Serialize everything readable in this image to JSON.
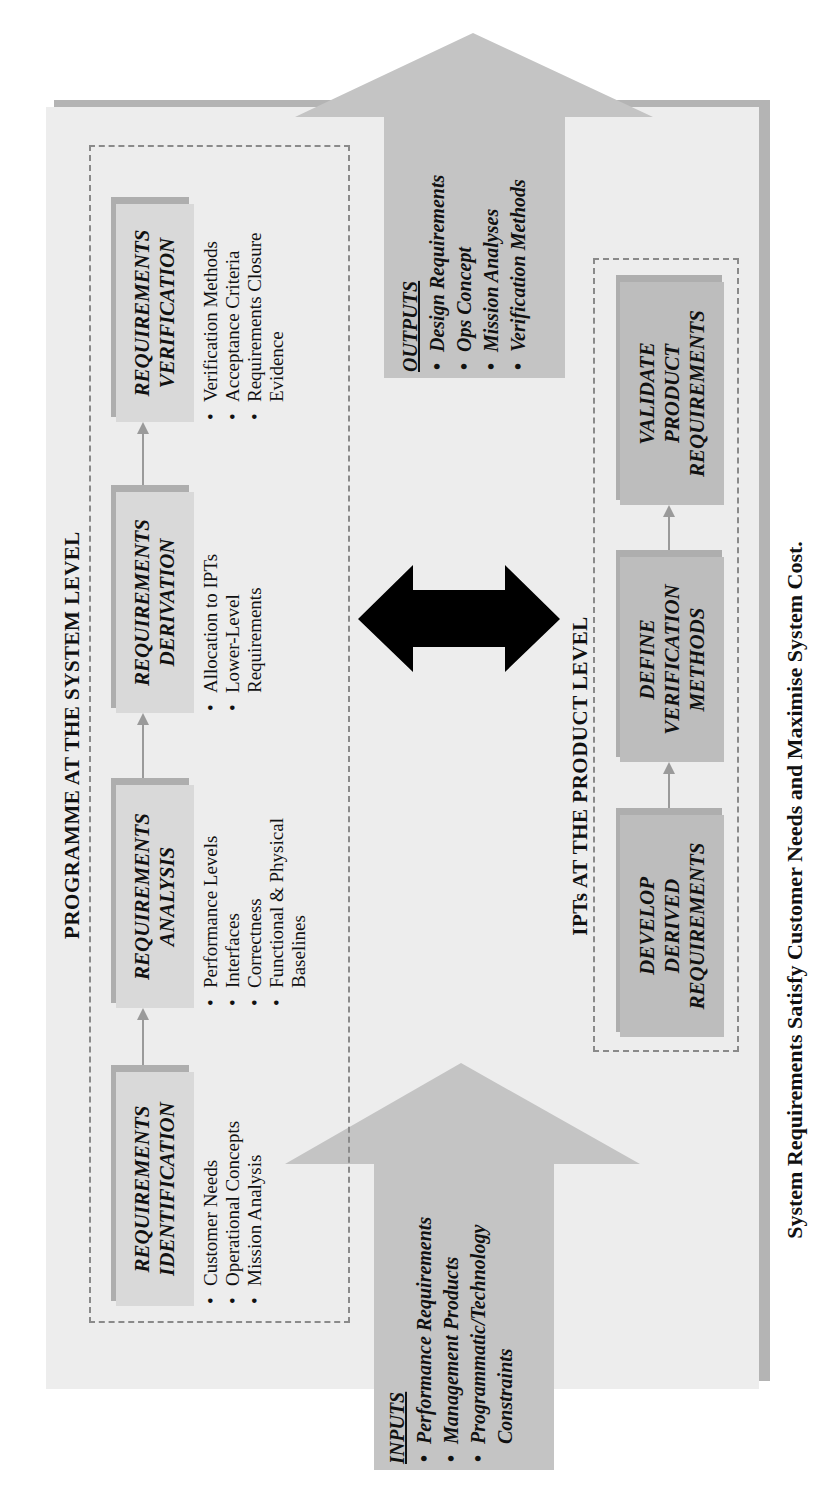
{
  "diagram": {
    "orientation": "rotated -90 degrees (landscape content shown in portrait)",
    "system_level": {
      "title": "PROGRAMME AT THE SYSTEM LEVEL",
      "steps": [
        {
          "title_lines": [
            "REQUIREMENTS",
            "IDENTIFICATION"
          ],
          "bullets": [
            "Customer Needs",
            "Operational Concepts",
            "Mission Analysis"
          ]
        },
        {
          "title_lines": [
            "REQUIREMENTS",
            "ANALYSIS"
          ],
          "bullets": [
            "Performance Levels",
            "Interfaces",
            "Correctness",
            "Functional & Physical Baselines"
          ]
        },
        {
          "title_lines": [
            "REQUIREMENTS",
            "DERIVATION"
          ],
          "bullets": [
            "Allocation to IPTs",
            "Lower-Level Requirements"
          ]
        },
        {
          "title_lines": [
            "REQUIREMENTS",
            "VERIFICATION"
          ],
          "bullets": [
            "Verification Methods",
            "Acceptance Criteria",
            "Requirements Closure Evidence"
          ]
        }
      ]
    },
    "product_level": {
      "title": "IPTs AT THE PRODUCT LEVEL",
      "steps": [
        {
          "title_lines": [
            "DEVELOP",
            "DERIVED",
            "REQUIREMENTS"
          ]
        },
        {
          "title_lines": [
            "DEFINE",
            "VERIFICATION",
            "METHODS"
          ]
        },
        {
          "title_lines": [
            "VALIDATE",
            "PRODUCT",
            "REQUIREMENTS"
          ]
        }
      ]
    },
    "inputs": {
      "heading": "INPUTS",
      "items": [
        "Performance Requirements",
        "Management Products",
        "Programmatic/Technology Constraints"
      ]
    },
    "outputs": {
      "heading": "OUTPUTS",
      "items": [
        "Design Requirements",
        "Ops Concept",
        "Mission Analyses",
        "Verification Methods"
      ]
    },
    "link_arrow": "double-headed arrow linking system level and product level",
    "caption": "System Requirements Satisfy Customer Needs and Maximise System Cost.",
    "colors": {
      "panel": "#ededed",
      "panel_shadow": "#b4b4b4",
      "step_box": "#d9d9d9",
      "step_box_product": "#bdbdbd",
      "io_arrow": "#c4c4c4",
      "link_arrow": "#000000",
      "dash_border": "#8a8a8a"
    }
  }
}
